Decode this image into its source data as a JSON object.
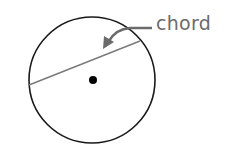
{
  "diagram": {
    "label": "chord",
    "colors": {
      "circle": "#1a1a1a",
      "chord": "#7a7a7a",
      "arrow": "#6b6b6b",
      "label": "#6b6b6b",
      "center": "#000000"
    },
    "circle": {
      "cx": 92,
      "cy": 80,
      "r": 63
    },
    "chord": {
      "x1": 29,
      "y1": 85,
      "x2": 140,
      "y2": 41
    },
    "center_point": {
      "cx": 93,
      "cy": 80,
      "r": 4
    }
  }
}
